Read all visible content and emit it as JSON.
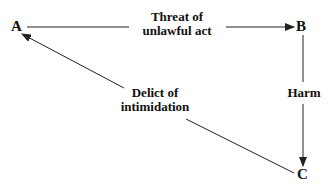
{
  "nodes": {
    "a": "A",
    "b": "B",
    "c": "C"
  },
  "edges": {
    "ab": {
      "line1": "Threat of",
      "line2": "unlawful act"
    },
    "bc": {
      "label": "Harm"
    },
    "ca": {
      "line1": "Delict of",
      "line2": "intimidation"
    }
  },
  "colors": {
    "stroke": "#222222",
    "text": "#111111"
  }
}
